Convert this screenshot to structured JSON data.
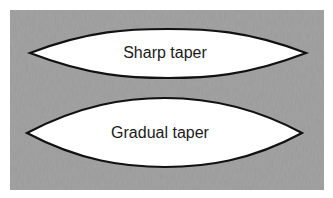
{
  "panel": {
    "background": "#9a9a9a"
  },
  "shapes": [
    {
      "label": "Sharp taper",
      "type": "lens",
      "fill": "#ffffff",
      "stroke": "#111111"
    },
    {
      "label": "Gradual taper",
      "type": "lens",
      "fill": "#ffffff",
      "stroke": "#111111"
    }
  ]
}
